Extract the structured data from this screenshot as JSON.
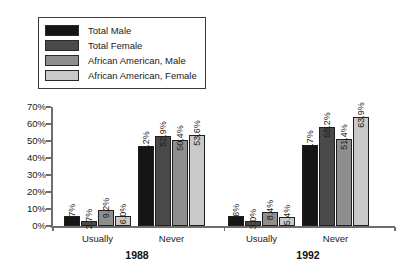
{
  "chart_data": {
    "type": "bar",
    "title": "",
    "xlabel": "",
    "ylabel": "",
    "ylim": [
      0,
      70
    ],
    "ytick_labels": [
      "0%",
      "10%",
      "20%",
      "30%",
      "40%",
      "50%",
      "60%",
      "70%"
    ],
    "ytick_values": [
      0,
      10,
      20,
      30,
      40,
      50,
      60,
      70
    ],
    "grid": false,
    "legend_position": "top-left",
    "categories": [
      "Usually",
      "Never",
      "Usually",
      "Never"
    ],
    "group_labels": [
      "1988",
      "1992"
    ],
    "series": [
      {
        "name": "Total Male",
        "color": "#151515",
        "values": [
          5.7,
          47.2,
          5.6,
          47.7
        ],
        "labels": [
          "5.7%",
          "47.2%",
          "5.6%",
          "47.7%"
        ]
      },
      {
        "name": "Total Female",
        "color": "#4a4a4a",
        "values": [
          2.7,
          52.9,
          3.0,
          58.2
        ],
        "labels": [
          "2.7%",
          "52.9%",
          "3.0%",
          "58.2%"
        ]
      },
      {
        "name": "African American, Male",
        "color": "#8e8e8e",
        "values": [
          9.2,
          50.4,
          8.4,
          51.4
        ],
        "labels": [
          "9.2%",
          "50.4%",
          "8.4%",
          "51.4%"
        ]
      },
      {
        "name": "African American, Female",
        "color": "#c9c9c9",
        "values": [
          6.0,
          53.6,
          5.4,
          63.9
        ],
        "labels": [
          "6.0%",
          "53.6%",
          "5.4%",
          "63.9%"
        ]
      }
    ]
  },
  "legend": {
    "entries": [
      {
        "label": "Total Male",
        "color": "#151515"
      },
      {
        "label": "Total Female",
        "color": "#4a4a4a"
      },
      {
        "label": "African American, Male",
        "color": "#8e8e8e"
      },
      {
        "label": "African American, Female",
        "color": "#c9c9c9"
      }
    ]
  },
  "axis": {
    "line_color": "#6e6e6e"
  }
}
